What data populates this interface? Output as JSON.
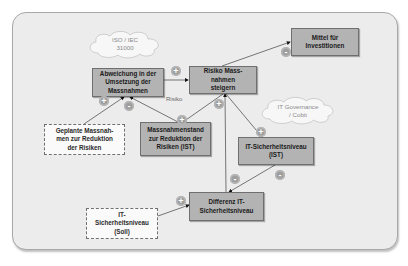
{
  "diagram": {
    "type": "causal-loop",
    "nodes": [
      {
        "id": "abweichung",
        "label": "Abweichung in der Umsetzung der Massnahmen",
        "style": "solid"
      },
      {
        "id": "risiko_steigern",
        "label": "Risiko Mass-nahmen  steigern",
        "style": "solid"
      },
      {
        "id": "mittel",
        "label": "Mittel für Investitionen",
        "style": "solid"
      },
      {
        "id": "geplante",
        "label": "Geplante Massnah-men zur Reduktion der Risiken",
        "style": "dashed"
      },
      {
        "id": "massnahmenstand",
        "label": "Massnahmenstand zur Reduktion der Risiken (IST)",
        "style": "solid"
      },
      {
        "id": "it_ist",
        "label": "IT-Sicherheitsniveau (IST)",
        "style": "solid"
      },
      {
        "id": "differenz",
        "label": "Differenz IT-Sicherheitsniveau",
        "style": "solid"
      },
      {
        "id": "it_soll",
        "label": "IT-Sicherheitsniveau (Soll)",
        "style": "dashed"
      }
    ],
    "clouds": [
      {
        "id": "iso",
        "line1": "ISO / IEC",
        "line2": "31000"
      },
      {
        "id": "governance",
        "line1": "IT Governance",
        "line2": "/ Cobit"
      }
    ],
    "edge_label": "Risiko",
    "edges": [
      {
        "from": "abweichung",
        "to": "risiko_steigern",
        "sign": "+"
      },
      {
        "from": "risiko_steigern",
        "to": "mittel",
        "sign": "-"
      },
      {
        "from": "geplante",
        "to": "abweichung",
        "sign": "+"
      },
      {
        "from": "massnahmenstand",
        "to": "abweichung",
        "sign": "-"
      },
      {
        "from": "risiko_steigern",
        "to": "massnahmenstand",
        "sign": "+"
      },
      {
        "from": "risiko_steigern",
        "to": "it_ist",
        "sign": "+"
      },
      {
        "from": "differenz",
        "to": "risiko_steigern",
        "sign": "+"
      },
      {
        "from": "it_ist",
        "to": "differenz",
        "sign": "-"
      },
      {
        "from": "it_soll",
        "to": "differenz",
        "sign": "+"
      }
    ],
    "signs": {
      "s1": "+",
      "s2": "-",
      "s3": "+",
      "s4": "-",
      "s5": "+",
      "s6": "+",
      "s7": "+",
      "s8": "-",
      "s9": "-",
      "s10": "+"
    }
  }
}
